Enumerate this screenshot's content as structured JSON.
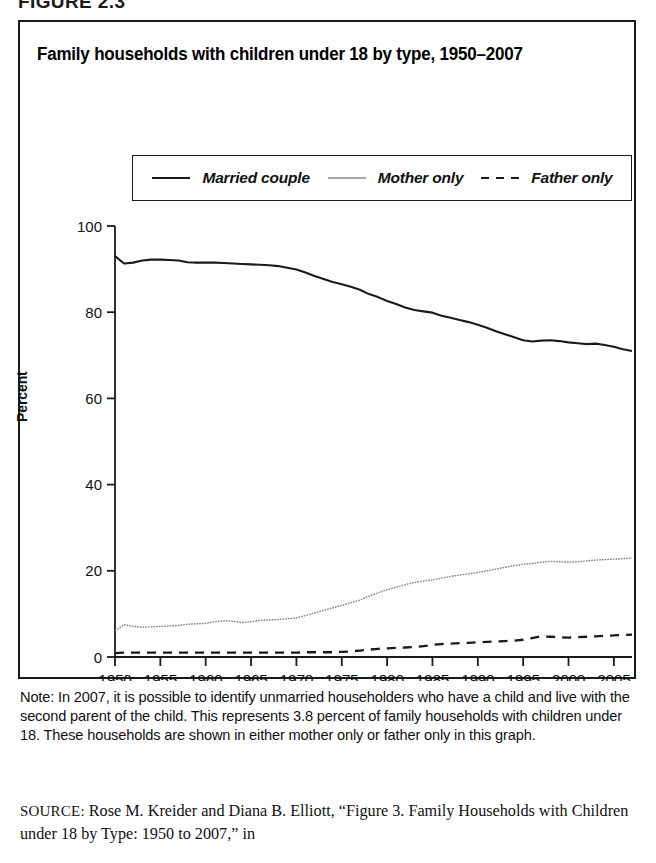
{
  "figure": {
    "label": "FIGURE 2.3"
  },
  "chart_box": {
    "title": "Family households with children under 18 by type, 1950–2007"
  },
  "legend": {
    "position": "top-inside-box",
    "items": [
      {
        "label": "Married couple",
        "style": "solid-thick",
        "color": "#1a1a1a",
        "icon": "line-solid-icon"
      },
      {
        "label": "Mother only",
        "style": "dotted-thin",
        "color": "#808080",
        "icon": "line-dotted-icon"
      },
      {
        "label": "Father only",
        "style": "dashed",
        "color": "#1a1a1a",
        "icon": "line-dashed-icon"
      }
    ]
  },
  "axes": {
    "ylabel": "Percent",
    "yticks": [
      "0",
      "20",
      "40",
      "60",
      "80",
      "100"
    ],
    "xticks": [
      "1950",
      "1955",
      "1960",
      "1965",
      "1970",
      "1975",
      "1980",
      "1985",
      "1990",
      "1995",
      "2000",
      "2005"
    ]
  },
  "note": {
    "text": "Note: In 2007, it is possible to identify unmarried householders who have a child and live with the second parent of the child. This represents 3.8 percent of family households with children under 18. These households are shown in either mother only or father only in this graph."
  },
  "source": {
    "prefix": "SOURCE:",
    "text": " Rose M. Kreider and Diana B. Elliott, “Figure 3. Family Households with Children under 18 by Type: 1950 to 2007,” in"
  },
  "chart_data": {
    "type": "line",
    "title": "Family households with children under 18 by type, 1950–2007",
    "xlabel": "",
    "ylabel": "Percent",
    "xlim": [
      1950,
      2007
    ],
    "ylim": [
      0,
      100
    ],
    "yticks": [
      0,
      20,
      40,
      60,
      80,
      100
    ],
    "xticks": [
      1950,
      1955,
      1960,
      1965,
      1970,
      1975,
      1980,
      1985,
      1990,
      1995,
      2000,
      2005
    ],
    "grid": false,
    "legend_position": "top",
    "x": [
      1950,
      1951,
      1952,
      1953,
      1954,
      1955,
      1956,
      1957,
      1958,
      1959,
      1960,
      1961,
      1962,
      1963,
      1964,
      1965,
      1966,
      1967,
      1968,
      1969,
      1970,
      1971,
      1972,
      1973,
      1974,
      1975,
      1976,
      1977,
      1978,
      1979,
      1980,
      1981,
      1982,
      1983,
      1984,
      1985,
      1986,
      1987,
      1988,
      1989,
      1990,
      1991,
      1992,
      1993,
      1994,
      1995,
      1996,
      1997,
      1998,
      1999,
      2000,
      2001,
      2002,
      2003,
      2004,
      2005,
      2006,
      2007
    ],
    "series": [
      {
        "name": "Married couple",
        "style": "solid-thick",
        "color": "#1a1a1a",
        "values": [
          93.0,
          91.3,
          91.5,
          92.0,
          92.2,
          92.2,
          92.1,
          92.0,
          91.6,
          91.5,
          91.5,
          91.5,
          91.4,
          91.3,
          91.2,
          91.1,
          91.0,
          90.9,
          90.7,
          90.3,
          89.9,
          89.2,
          88.4,
          87.7,
          87.0,
          86.5,
          85.9,
          85.2,
          84.2,
          83.5,
          82.6,
          81.9,
          81.1,
          80.5,
          80.2,
          79.9,
          79.2,
          78.7,
          78.2,
          77.7,
          77.1,
          76.4,
          75.6,
          74.9,
          74.2,
          73.5,
          73.2,
          73.4,
          73.5,
          73.3,
          73.0,
          72.8,
          72.6,
          72.7,
          72.4,
          72.0,
          71.4,
          71.0
        ]
      },
      {
        "name": "Mother only",
        "style": "dotted-thin",
        "color": "#808080",
        "values": [
          6.1,
          7.5,
          7.1,
          6.9,
          7.0,
          7.1,
          7.2,
          7.3,
          7.6,
          7.7,
          7.8,
          8.2,
          8.4,
          8.3,
          8.0,
          8.2,
          8.5,
          8.6,
          8.7,
          8.9,
          9.1,
          9.6,
          10.2,
          10.8,
          11.4,
          12.0,
          12.6,
          13.2,
          14.1,
          14.9,
          15.6,
          16.2,
          16.8,
          17.3,
          17.6,
          17.9,
          18.3,
          18.7,
          19.0,
          19.3,
          19.6,
          20.0,
          20.4,
          20.8,
          21.2,
          21.5,
          21.7,
          22.0,
          22.2,
          22.1,
          22.0,
          22.1,
          22.3,
          22.5,
          22.6,
          22.7,
          22.8,
          23.0
        ]
      },
      {
        "name": "Father only",
        "style": "dashed",
        "color": "#1a1a1a",
        "values": [
          0.9,
          1.0,
          1.0,
          1.0,
          1.0,
          1.0,
          1.0,
          1.0,
          1.0,
          1.0,
          1.0,
          1.0,
          1.0,
          1.0,
          1.0,
          1.0,
          1.0,
          1.0,
          1.0,
          1.0,
          1.0,
          1.1,
          1.1,
          1.1,
          1.1,
          1.2,
          1.3,
          1.5,
          1.7,
          1.9,
          2.0,
          2.1,
          2.2,
          2.3,
          2.5,
          2.8,
          3.0,
          3.1,
          3.2,
          3.3,
          3.4,
          3.5,
          3.6,
          3.7,
          3.8,
          4.0,
          4.4,
          4.8,
          4.7,
          4.6,
          4.5,
          4.6,
          4.7,
          4.8,
          4.9,
          5.0,
          5.1,
          5.2
        ]
      }
    ]
  }
}
